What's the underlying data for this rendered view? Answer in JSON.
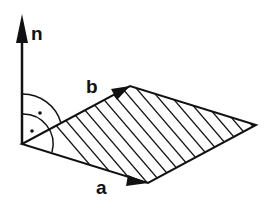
{
  "diagram": {
    "title": "",
    "colors": {
      "stroke": "#111111",
      "background": "#ffffff"
    },
    "vectors": {
      "n": {
        "label": "n",
        "from": [
          22,
          144
        ],
        "to": [
          22,
          14
        ]
      },
      "b": {
        "label": "b",
        "from": [
          22,
          144
        ],
        "to": [
          130,
          86
        ]
      },
      "a": {
        "label": "a",
        "from": [
          22,
          144
        ],
        "to": [
          148,
          183
        ]
      }
    },
    "parallelogram": {
      "vertices": [
        [
          22,
          144
        ],
        [
          130,
          86
        ],
        [
          256,
          125
        ],
        [
          148,
          183
        ]
      ],
      "fill": "hatched"
    },
    "right_angle_marks": 2
  }
}
